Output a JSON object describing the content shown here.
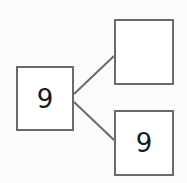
{
  "diagram": {
    "type": "number-bond",
    "whole": {
      "value": "9"
    },
    "parts": [
      {
        "value": ""
      },
      {
        "value": "9"
      }
    ],
    "line_color": "#6a6a6a",
    "border_color": "#6a6a6a"
  }
}
